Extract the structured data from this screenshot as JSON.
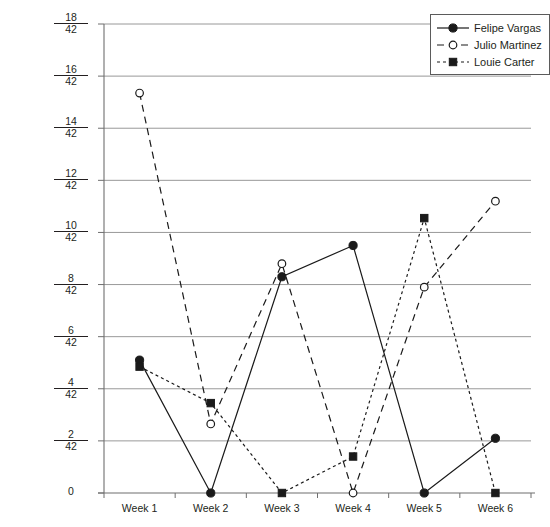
{
  "chart_data": {
    "type": "line",
    "title": "",
    "subtitle": "",
    "xlabel": "",
    "ylabel": "",
    "categories": [
      "Week 1",
      "Week 2",
      "Week 3",
      "Week 4",
      "Week 5",
      "Week 6"
    ],
    "y_denominator": 42,
    "ytick_numerators": [
      0,
      2,
      4,
      6,
      8,
      10,
      12,
      14,
      16,
      18
    ],
    "ytick_labels": [
      "0",
      "2/42",
      "4/42",
      "6/42",
      "8/42",
      "10/42",
      "12/42",
      "14/42",
      "16/42",
      "18/42"
    ],
    "ylim": [
      0,
      18
    ],
    "grid": true,
    "legend_position": "top-right",
    "series": [
      {
        "name": "Felipe Vargas",
        "marker": "filled-circle",
        "linestyle": "solid",
        "color": "#1a1a1a",
        "values": [
          5.1,
          0,
          8.3,
          9.5,
          0,
          2.1
        ]
      },
      {
        "name": "Julio Martinez",
        "marker": "open-circle",
        "linestyle": "dashed",
        "color": "#1a1a1a",
        "values": [
          15.35,
          2.65,
          8.8,
          0,
          7.9,
          11.2
        ]
      },
      {
        "name": "Louie Carter",
        "marker": "filled-square",
        "linestyle": "dotted",
        "color": "#1a1a1a",
        "values": [
          4.85,
          3.45,
          0,
          1.4,
          10.55,
          0
        ]
      }
    ]
  },
  "legend": {
    "items": [
      {
        "label": "Felipe Vargas"
      },
      {
        "label": "Julio Martinez"
      },
      {
        "label": "Louie Carter"
      }
    ]
  },
  "colors": {
    "ink": "#231f20",
    "grid": "#8d8d8d",
    "axis": "#6f6f6f",
    "background": "#ffffff"
  }
}
